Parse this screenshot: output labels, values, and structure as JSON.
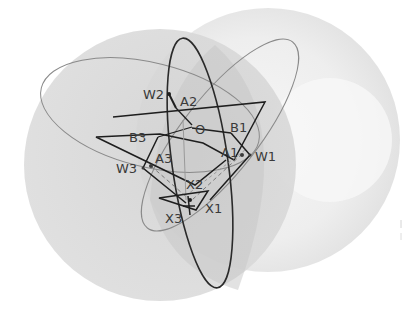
{
  "diagram": {
    "colors": {
      "sphere_light": "#ececec",
      "sphere_dark": "#d2d2d2",
      "ellipse_thin": "#8a8a8a",
      "ellipse_bold": "#2a2a2a",
      "polygon": "#1e1e1e",
      "dashed": "#7a7a7a",
      "label": "#3a3a3a"
    },
    "labels": {
      "W2": "W2",
      "A2": "A2",
      "O": "O",
      "B1": "B1",
      "B3": "B3",
      "A3": "A3",
      "A1": "A1",
      "W1": "W1",
      "W3": "W3",
      "X2": "X2",
      "X1": "X1",
      "X3": "X3"
    }
  }
}
